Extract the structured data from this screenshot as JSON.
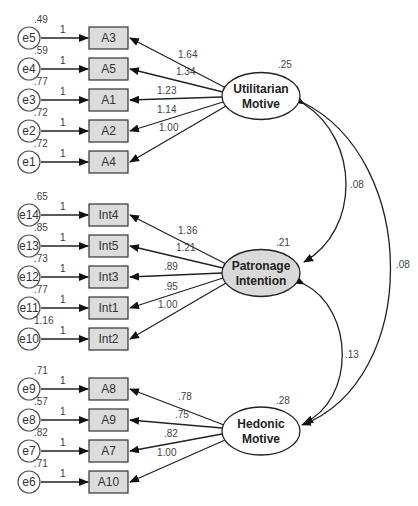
{
  "diagram": {
    "type": "SEM path diagram",
    "latents": [
      {
        "id": "utilitarian",
        "line1": "Utilitarian",
        "line2": "Motive",
        "variance": ".25",
        "fill": "#ffffff",
        "cx": 261,
        "cy": 96
      },
      {
        "id": "patronage",
        "line1": "Patronage",
        "line2": "Intention",
        "variance": ".21",
        "fill": "#d9d9d9",
        "cx": 261,
        "cy": 273
      },
      {
        "id": "hedonic",
        "line1": "Hedonic",
        "line2": "Motive",
        "variance": ".28",
        "fill": "#ffffff",
        "cx": 261,
        "cy": 431
      }
    ],
    "indicators": [
      {
        "name": "A3",
        "error": "e5",
        "error_variance": ".49",
        "fixed": "1",
        "loading": "1.64",
        "latent": "utilitarian",
        "y": 38
      },
      {
        "name": "A5",
        "error": "e4",
        "error_variance": ".59",
        "fixed": "1",
        "loading": "1.34",
        "latent": "utilitarian",
        "y": 69
      },
      {
        "name": "A1",
        "error": "e3",
        "error_variance": ".77",
        "fixed": "1",
        "loading": "1.23",
        "latent": "utilitarian",
        "y": 100
      },
      {
        "name": "A2",
        "error": "e2",
        "error_variance": ".72",
        "fixed": "1",
        "loading": "1.14",
        "latent": "utilitarian",
        "y": 131
      },
      {
        "name": "A4",
        "error": "e1",
        "error_variance": ".72",
        "fixed": "1",
        "loading": "1.00",
        "latent": "utilitarian",
        "y": 162
      },
      {
        "name": "Int4",
        "error": "e14",
        "error_variance": ".65",
        "fixed": "1",
        "loading": "1.36",
        "latent": "patronage",
        "y": 215
      },
      {
        "name": "Int5",
        "error": "e13",
        "error_variance": ".85",
        "fixed": "1",
        "loading": "1.21",
        "latent": "patronage",
        "y": 246
      },
      {
        "name": "Int3",
        "error": "e12",
        "error_variance": ".73",
        "fixed": "1",
        "loading": ".89",
        "latent": "patronage",
        "y": 277
      },
      {
        "name": "Int1",
        "error": "e11",
        "error_variance": ".77",
        "fixed": "1",
        "loading": ".95",
        "latent": "patronage",
        "y": 308
      },
      {
        "name": "Int2",
        "error": "e10",
        "error_variance": "1.16",
        "fixed": "1",
        "loading": "1.00",
        "latent": "patronage",
        "y": 339
      },
      {
        "name": "A8",
        "error": "e9",
        "error_variance": ".71",
        "fixed": "1",
        "loading": ".78",
        "latent": "hedonic",
        "y": 389
      },
      {
        "name": "A9",
        "error": "e8",
        "error_variance": ".57",
        "fixed": "1",
        "loading": ".75",
        "latent": "hedonic",
        "y": 420
      },
      {
        "name": "A7",
        "error": "e7",
        "error_variance": ".82",
        "fixed": "1",
        "loading": ".82",
        "latent": "hedonic",
        "y": 451
      },
      {
        "name": "A10",
        "error": "e6",
        "error_variance": ".71",
        "fixed": "1",
        "loading": "1.00",
        "latent": "hedonic",
        "y": 482
      }
    ],
    "covariances": [
      {
        "from": "utilitarian",
        "to": "patronage",
        "value": ".08"
      },
      {
        "from": "patronage",
        "to": "hedonic",
        "value": ".13"
      },
      {
        "from": "utilitarian",
        "to": "hedonic",
        "value": ".08"
      }
    ],
    "colors": {
      "indicator_fill": "#dcdcdc",
      "patronage_fill": "#d9d9d9",
      "stroke": "#222222"
    }
  }
}
